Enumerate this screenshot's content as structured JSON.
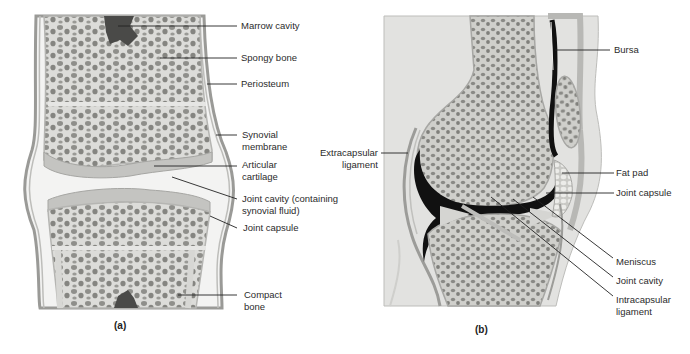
{
  "panel_a": {
    "caption": "(a)",
    "labels": {
      "marrow_cavity": "Marrow cavity",
      "spongy_bone": "Spongy bone",
      "periosteum": "Periosteum",
      "synovial_membrane_1": "Synovial",
      "synovial_membrane_2": "membrane",
      "articular_cartilage_1": "Articular",
      "articular_cartilage_2": "cartilage",
      "joint_cavity_1": "Joint cavity (containing",
      "joint_cavity_2": "synovial fluid)",
      "joint_capsule": "Joint capsule",
      "compact_bone_1": "Compact",
      "compact_bone_2": "bone"
    }
  },
  "panel_b": {
    "caption": "(b)",
    "labels": {
      "bursa": "Bursa",
      "extracapsular_ligament_1": "Extracapsular",
      "extracapsular_ligament_2": "ligament",
      "fat_pad": "Fat pad",
      "joint_capsule": "Joint capsule",
      "meniscus": "Meniscus",
      "joint_cavity": "Joint cavity",
      "intracapsular_ligament_1": "Intracapsular",
      "intracapsular_ligament_2": "ligament"
    }
  },
  "colors": {
    "bone": "#d9d9d6",
    "spongy_hole": "#8c8c88",
    "marrow": "#4a4a48",
    "capsule": "#a9a9a6",
    "cavity_dark": "#111111",
    "soft_tissue": "#e3e3e1",
    "leader_line": "#222222"
  }
}
